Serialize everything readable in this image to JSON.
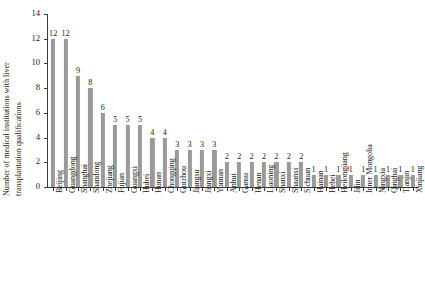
{
  "chart_data": {
    "type": "bar",
    "title": "",
    "subtitle": "",
    "xlabel": "",
    "ylabel": "Number of medical institutions with liver transplantation qualifications",
    "ylabel_line1": "Number of medical institutions with liver",
    "ylabel_line2": "transplantation qualifications",
    "ylim": [
      0,
      14
    ],
    "y_ticks": [
      0,
      2,
      4,
      6,
      8,
      10,
      12,
      14
    ],
    "y_tick_labels": [
      "0",
      "2",
      "4",
      "6",
      "8",
      "10",
      "12",
      "14"
    ],
    "grid": false,
    "legend": "none",
    "bar_color": "#9a9a9a",
    "axis_color": "#3a3a3a",
    "text_color": "#1a1a1a",
    "show_value_labels": true,
    "categories": [
      "Beijing",
      "Guangdong",
      "Shanghai",
      "Shandong",
      "Zhejiang",
      "Fujian",
      "Guangxi",
      "Hubei",
      "Hunan",
      "Chongqing",
      "Guizhou",
      "Jiangsu",
      "Jiangxi",
      "Yunnan",
      "Anhui",
      "Gansu",
      "Henan",
      "Liaoning",
      "Shanxi",
      "Shaanxi",
      "Sichuan",
      "Hainan",
      "Hebei",
      "Heilongjiang",
      "Jilin",
      "Inner Mongolia",
      "Ningxia",
      "Qinghai",
      "Tianjin",
      "Xinjiang"
    ],
    "values": [
      12,
      12,
      9,
      8,
      6,
      5,
      5,
      5,
      4,
      4,
      3,
      3,
      3,
      3,
      2,
      2,
      2,
      2,
      2,
      2,
      2,
      1,
      1,
      1,
      1,
      1,
      1,
      1,
      1,
      1
    ],
    "value_labels": [
      "12",
      "12",
      "9",
      "8",
      "6",
      "5",
      "5",
      "5",
      "4",
      "4",
      "3",
      "3",
      "3",
      "3",
      "2",
      "2",
      "2",
      "2",
      "2",
      "2",
      "2",
      "1",
      "1",
      "1",
      "1",
      "1",
      "1",
      "1",
      "1",
      "1"
    ]
  }
}
